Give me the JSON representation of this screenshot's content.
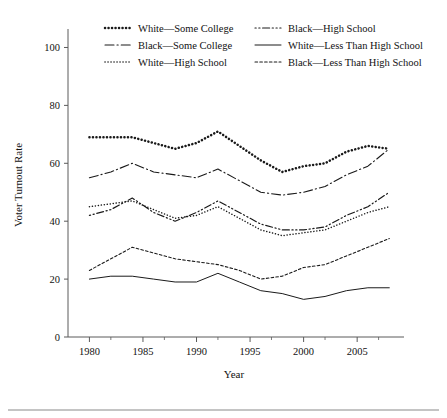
{
  "figure": {
    "y_axis_title": "Voter Turnout Rate",
    "x_axis_title": "Year"
  },
  "legend": {
    "entries": [
      {
        "label": "White—Some College",
        "style": "dotted-thick",
        "column": 0,
        "row": 0
      },
      {
        "label": "Black—Some College",
        "style": "dash-dot",
        "column": 0,
        "row": 1
      },
      {
        "label": "White—High School",
        "style": "dotted-fine",
        "column": 0,
        "row": 2
      },
      {
        "label": "Black—High School",
        "style": "dot-dot-dash",
        "column": 1,
        "row": 0
      },
      {
        "label": "White—Less Than High School",
        "style": "solid",
        "column": 1,
        "row": 1
      },
      {
        "label": "Black—Less Than High School",
        "style": "dashed-fine",
        "column": 1,
        "row": 2
      }
    ]
  },
  "chart_data": {
    "type": "line",
    "title": "",
    "xlabel": "Year",
    "ylabel": "Voter Turnout Rate",
    "xlim": [
      1978,
      2009
    ],
    "ylim": [
      0,
      105
    ],
    "yticks": [
      0,
      20,
      40,
      60,
      80,
      100
    ],
    "xticks": [
      1980,
      1985,
      1990,
      1995,
      2000,
      2005
    ],
    "x_minor_ticks": [
      1982,
      1987,
      1992,
      1997,
      2002,
      2007
    ],
    "grid": false,
    "legend_position": "top",
    "x": [
      1980,
      1982,
      1984,
      1986,
      1988,
      1990,
      1992,
      1994,
      1996,
      1998,
      2000,
      2002,
      2004,
      2006,
      2008
    ],
    "series": [
      {
        "name": "White—Some College",
        "style": "dotted-thick",
        "values": [
          69,
          69,
          69,
          67,
          65,
          67,
          71,
          66,
          61,
          57,
          59,
          60,
          64,
          66,
          65
        ]
      },
      {
        "name": "Black—Some College",
        "style": "dash-dot",
        "values": [
          55,
          57,
          60,
          57,
          56,
          55,
          58,
          54,
          50,
          49,
          50,
          52,
          56,
          59,
          65
        ]
      },
      {
        "name": "White—High School",
        "style": "dotted-fine",
        "values": [
          45,
          46,
          47,
          44,
          41,
          42,
          45,
          41,
          37,
          35,
          36,
          37,
          40,
          43,
          45
        ]
      },
      {
        "name": "Black—High School",
        "style": "dot-dot-dash",
        "values": [
          42,
          44,
          48,
          43,
          40,
          43,
          47,
          43,
          39,
          37,
          37,
          38,
          42,
          45,
          50
        ]
      },
      {
        "name": "Black—Less Than High School",
        "style": "dashed-fine",
        "values": [
          23,
          27,
          31,
          29,
          27,
          26,
          25,
          23,
          20,
          21,
          24,
          25,
          28,
          31,
          34
        ]
      },
      {
        "name": "White—Less Than High School",
        "style": "solid",
        "values": [
          20,
          21,
          21,
          20,
          19,
          19,
          22,
          19,
          16,
          15,
          13,
          14,
          16,
          17,
          17
        ]
      }
    ]
  }
}
